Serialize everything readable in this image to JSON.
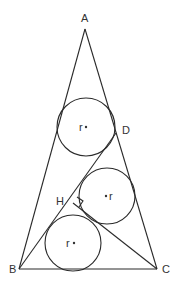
{
  "figure": {
    "points": {
      "A": {
        "label": "A",
        "x": 85,
        "y": 29,
        "lx": 81,
        "ly": 22
      },
      "B": {
        "label": "B",
        "x": 19,
        "y": 269,
        "lx": 9,
        "ly": 273
      },
      "C": {
        "label": "C",
        "x": 157,
        "y": 269,
        "lx": 162,
        "ly": 273
      },
      "D": {
        "label": "D",
        "x": 116,
        "y": 133,
        "lx": 122,
        "ly": 134
      },
      "H": {
        "label": "H",
        "x": 73,
        "y": 203,
        "lx": 57,
        "ly": 205
      }
    },
    "circles": [
      {
        "name": "top",
        "cx": 86,
        "cy": 127,
        "r": 29,
        "label": "r",
        "lx": 80,
        "ly": 135
      },
      {
        "name": "middle",
        "cx": 107,
        "cy": 196,
        "r": 28,
        "label": "r",
        "lx": 110,
        "ly": 204
      },
      {
        "name": "bottom",
        "cx": 73,
        "cy": 243,
        "r": 28,
        "label": "r",
        "lx": 65,
        "ly": 251
      }
    ]
  }
}
